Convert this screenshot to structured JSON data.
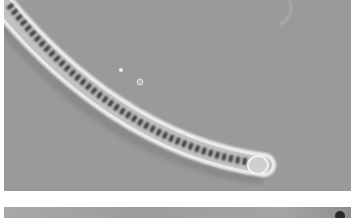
{
  "image": {
    "description": "Phase-contrast micrograph of a curved filamentous trichome with a rounded tip",
    "panels": [
      {
        "id": "top",
        "content": "curved filament with granular interior ending in rounded terminal cell"
      },
      {
        "id": "bottom",
        "content": "partially visible second micrograph panel"
      }
    ],
    "colors": {
      "background": "#9a9a9a",
      "filament_halo": "#e8e8e8",
      "filament_interior": "#bdbdbd",
      "granules": "#3a3a3a",
      "page": "#ffffff"
    }
  }
}
